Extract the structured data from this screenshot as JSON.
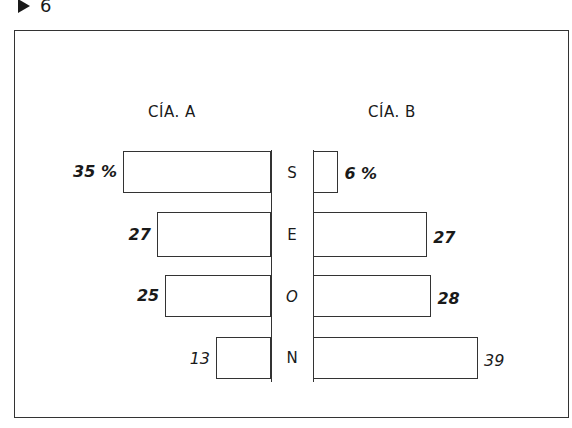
{
  "page": {
    "marker_number": "6"
  },
  "chart_data": {
    "type": "bar",
    "orientation": "horizontal-butterfly",
    "title": "",
    "categories": [
      "S",
      "E",
      "O",
      "N"
    ],
    "series": [
      {
        "name": "CÍA. A",
        "values": [
          35,
          27,
          25,
          13
        ],
        "labels": [
          "35 %",
          "27",
          "25",
          "13"
        ]
      },
      {
        "name": "CÍA. B",
        "values": [
          6,
          27,
          28,
          39
        ],
        "labels": [
          "6 %",
          "27",
          "28",
          "39"
        ]
      }
    ],
    "unit": "%",
    "xlabel": "",
    "ylabel": "",
    "grid": false,
    "legend_position": "top (series headers)"
  },
  "labels": {
    "company_a": "CÍA. A",
    "company_b": "CÍA. B"
  },
  "colors": {
    "ink": "#333333",
    "background": "#ffffff"
  }
}
